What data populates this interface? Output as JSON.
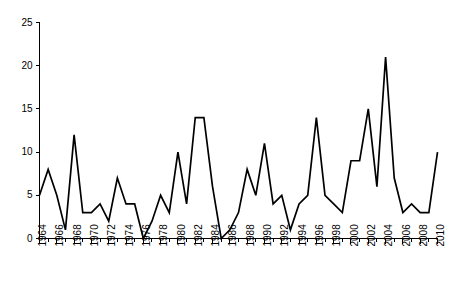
{
  "chart_data": {
    "type": "line",
    "title": "",
    "subtitle": "",
    "xlabel": "",
    "ylabel": "",
    "xlim": [
      1964,
      2010
    ],
    "ylim": [
      0,
      25
    ],
    "grid": false,
    "legend": null,
    "legend_position": "none",
    "line_color": "#000000",
    "axis_color": "#000000",
    "background_color": "#ffffff",
    "y_ticks": [
      0,
      5,
      10,
      15,
      20,
      25
    ],
    "y_tick_labels": [
      "0",
      "5",
      "10",
      "15",
      "20",
      "25"
    ],
    "x_tick_labels": [
      "1964",
      "1966",
      "1968",
      "1970",
      "1972",
      "1974",
      "1976",
      "1978",
      "1980",
      "1982",
      "1984",
      "1986",
      "1988",
      "1990",
      "1992",
      "1994",
      "1996",
      "1998",
      "2000",
      "2002",
      "2004",
      "2006",
      "2008",
      "2010"
    ],
    "x_tick_label_interval": 2,
    "x_minor_tick_interval": 1,
    "x": [
      1964,
      1965,
      1966,
      1967,
      1968,
      1969,
      1970,
      1971,
      1972,
      1973,
      1974,
      1975,
      1976,
      1977,
      1978,
      1979,
      1980,
      1981,
      1982,
      1983,
      1984,
      1985,
      1986,
      1987,
      1988,
      1989,
      1990,
      1991,
      1992,
      1993,
      1994,
      1995,
      1996,
      1997,
      1998,
      1999,
      2000,
      2001,
      2002,
      2003,
      2004,
      2005,
      2006,
      2007,
      2008,
      2009,
      2010
    ],
    "values": [
      5,
      8,
      5,
      1,
      12,
      3,
      3,
      4,
      2,
      7,
      4,
      4,
      0,
      2,
      5,
      3,
      10,
      4,
      14,
      14,
      6,
      0,
      1,
      3,
      8,
      5,
      11,
      4,
      5,
      1,
      4,
      5,
      14,
      5,
      4,
      3,
      9,
      9,
      15,
      6,
      21,
      7,
      3,
      4,
      3,
      3,
      10
    ],
    "series": [
      {
        "name": "series-1",
        "color": "#000000",
        "values": [
          5,
          8,
          5,
          1,
          12,
          3,
          3,
          4,
          2,
          7,
          4,
          4,
          0,
          2,
          5,
          3,
          10,
          4,
          14,
          14,
          6,
          0,
          1,
          3,
          8,
          5,
          11,
          4,
          5,
          1,
          4,
          5,
          14,
          5,
          4,
          3,
          9,
          9,
          15,
          6,
          21,
          7,
          3,
          4,
          3,
          3,
          10
        ]
      }
    ],
    "max_value": 21,
    "max_value_year": 2004,
    "min_value": 0,
    "min_value_years": [
      1976,
      1985
    ]
  }
}
